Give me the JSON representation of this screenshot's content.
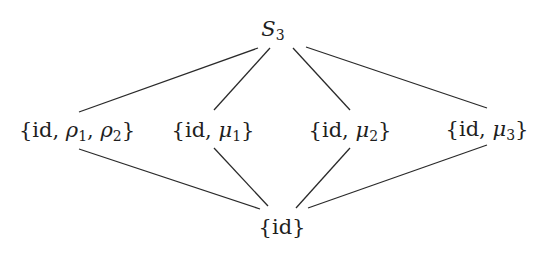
{
  "diagram": {
    "type": "subgroup-lattice",
    "nodes": [
      {
        "id": "top",
        "label": "S3",
        "base": "S",
        "sub": "3",
        "x": 273,
        "y": 30
      },
      {
        "id": "rho",
        "label": "{id, ρ1, ρ2}",
        "x": 77,
        "y": 131
      },
      {
        "id": "mu1",
        "label": "{id, μ1}",
        "x": 213,
        "y": 131
      },
      {
        "id": "mu2",
        "label": "{id, μ2}",
        "x": 350,
        "y": 131
      },
      {
        "id": "mu3",
        "label": "{id, μ3}",
        "x": 487,
        "y": 130
      },
      {
        "id": "bottom",
        "label": "{id}",
        "x": 282,
        "y": 227
      }
    ],
    "edges": [
      {
        "from": "top",
        "to": "rho",
        "x1": 258,
        "y1": 48,
        "x2": 79,
        "y2": 112
      },
      {
        "from": "top",
        "to": "mu1",
        "x1": 270,
        "y1": 48,
        "x2": 214,
        "y2": 110
      },
      {
        "from": "top",
        "to": "mu2",
        "x1": 293,
        "y1": 48,
        "x2": 350,
        "y2": 110
      },
      {
        "from": "top",
        "to": "mu3",
        "x1": 306,
        "y1": 47,
        "x2": 487,
        "y2": 108
      },
      {
        "from": "rho",
        "to": "bottom",
        "x1": 79,
        "y1": 149,
        "x2": 260,
        "y2": 209
      },
      {
        "from": "mu1",
        "to": "bottom",
        "x1": 214,
        "y1": 148,
        "x2": 268,
        "y2": 206
      },
      {
        "from": "mu2",
        "to": "bottom",
        "x1": 350,
        "y1": 148,
        "x2": 296,
        "y2": 208
      },
      {
        "from": "mu3",
        "to": "bottom",
        "x1": 487,
        "y1": 145,
        "x2": 308,
        "y2": 208
      }
    ],
    "text": {
      "top_base": "S",
      "top_sub": "3",
      "open": "{",
      "close": "}",
      "id": "id",
      "comma": ", ",
      "rho": "ρ",
      "mu": "μ",
      "sub1": "1",
      "sub2": "2",
      "sub3": "3"
    }
  }
}
